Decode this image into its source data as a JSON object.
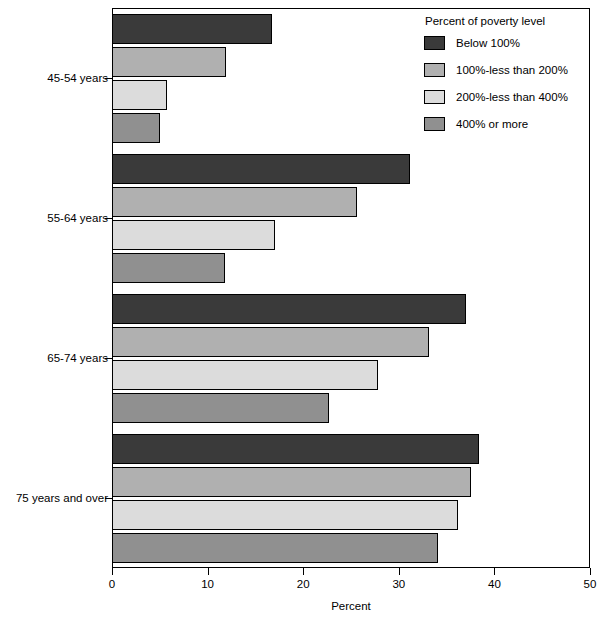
{
  "chart_data": {
    "type": "bar",
    "orientation": "horizontal",
    "title": "",
    "xlabel": "Percent",
    "ylabel": "",
    "xlim": [
      0,
      50
    ],
    "xticks": [
      0,
      10,
      20,
      30,
      40,
      50
    ],
    "xtick_labels": [
      "0",
      "10",
      "20",
      "30",
      "40",
      "50"
    ],
    "grid": false,
    "legend_position": "top-right",
    "legend_title": "Percent of poverty level",
    "categories": [
      "45-54 years",
      "55-64 years",
      "65-74 years",
      "75 years and over"
    ],
    "series": [
      {
        "name": "Below 100%",
        "color": "#3a3a3a",
        "values": [
          16.7,
          31.2,
          37.0,
          38.4
        ]
      },
      {
        "name": "100%-less than 200%",
        "color": "#b0b0b0",
        "values": [
          11.9,
          25.6,
          33.2,
          37.5
        ]
      },
      {
        "name": "200%-less than 400%",
        "color": "#dcdcdc",
        "values": [
          5.8,
          17.0,
          27.8,
          36.2
        ]
      },
      {
        "name": "400% or more",
        "color": "#909090",
        "values": [
          5.0,
          11.8,
          22.7,
          34.1
        ]
      }
    ]
  },
  "axis": {
    "x_title": "Percent"
  },
  "legend": {
    "title": "Percent of poverty level",
    "entries": [
      {
        "label": "Below 100%",
        "color": "#3a3a3a"
      },
      {
        "label": "100%-less than 200%",
        "color": "#b0b0b0"
      },
      {
        "label": "200%-less than 400%",
        "color": "#dcdcdc"
      },
      {
        "label": "400% or more",
        "color": "#909090"
      }
    ]
  }
}
